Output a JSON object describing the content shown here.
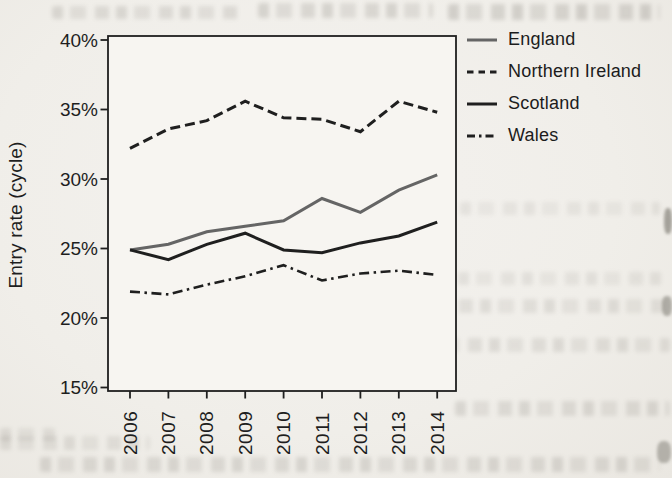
{
  "figure": {
    "kind": "scanned-book-figure",
    "paper_color": "#f0eee9",
    "ink_color": "#1f1f1f"
  },
  "chart_data": {
    "type": "line",
    "title": "",
    "xlabel": "",
    "ylabel": "Entry rate (cycle)",
    "x": [
      2006,
      2007,
      2008,
      2009,
      2010,
      2011,
      2012,
      2013,
      2014
    ],
    "x_tick_rotation": -90,
    "ylim": [
      15,
      40
    ],
    "yticks": [
      15,
      20,
      25,
      30,
      35,
      40
    ],
    "ytick_suffix": "%",
    "grid": false,
    "legend_position": "top-right",
    "series": [
      {
        "name": "England",
        "style": "solid",
        "color": "#656565",
        "values": [
          24.9,
          25.3,
          26.2,
          26.6,
          27.0,
          28.6,
          27.6,
          29.2,
          30.3
        ]
      },
      {
        "name": "Northern Ireland",
        "style": "dashed",
        "color": "#1f1f1f",
        "values": [
          32.2,
          33.6,
          34.2,
          35.6,
          34.4,
          34.3,
          33.4,
          35.6,
          34.8
        ]
      },
      {
        "name": "Scotland",
        "style": "solid",
        "color": "#1f1f1f",
        "values": [
          24.9,
          24.2,
          25.3,
          26.1,
          24.9,
          24.7,
          25.4,
          25.9,
          26.9
        ]
      },
      {
        "name": "Wales",
        "style": "dashdot",
        "color": "#1f1f1f",
        "values": [
          21.9,
          21.7,
          22.4,
          23.0,
          23.8,
          22.7,
          23.2,
          23.4,
          23.1
        ]
      }
    ]
  }
}
